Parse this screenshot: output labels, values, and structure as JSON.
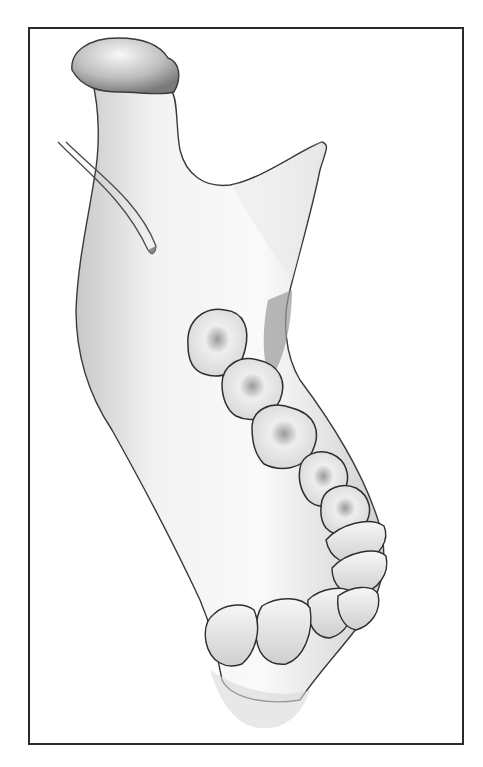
{
  "figure": {
    "style": "grayscale pencil anatomical drawing",
    "frame_color": "#2a2a2a",
    "background": "#ffffff",
    "bone_light": "#f4f4f4",
    "bone_shadow": "#8a8a8a",
    "outline": "#3a3a3a"
  }
}
